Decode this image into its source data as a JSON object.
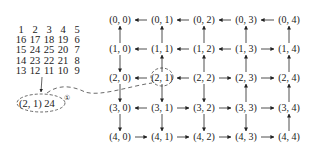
{
  "spiral_matrix": {
    "rows": [
      [
        "1",
        "2",
        "3",
        "4",
        "5"
      ],
      [
        "16",
        "17",
        "18",
        "19",
        "6"
      ],
      [
        "15",
        "24",
        "25",
        "20",
        "7"
      ],
      [
        "14",
        "23",
        "22",
        "21",
        "8"
      ],
      [
        "13",
        "12",
        "11",
        "10",
        "9"
      ]
    ]
  },
  "callout": {
    "label": "(2, 1)  24",
    "marker": "①"
  },
  "grid": {
    "rows": 5,
    "cols": 5,
    "nodes": [
      [
        "(0, 0)",
        "(0, 1)",
        "(0, 2)",
        "(0, 3)",
        "(0, 4)"
      ],
      [
        "(1, 0)",
        "(1, 1)",
        "(1, 2)",
        "(1, 3)",
        "(1, 4)"
      ],
      [
        "(2, 0)",
        "(2, 1)",
        "(2, 2)",
        "(2, 3)",
        "(2, 4)"
      ],
      [
        "(3, 0)",
        "(3, 1)",
        "(3, 2)",
        "(3, 3)",
        "(3, 4)"
      ],
      [
        "(4, 0)",
        "(4, 1)",
        "(4, 2)",
        "(4, 3)",
        "(4, 4)"
      ]
    ],
    "horizontal_arrows": [
      [
        "left",
        "left",
        "left",
        "left"
      ],
      [
        "left",
        "left",
        "left",
        "right"
      ],
      [
        "left",
        "left",
        "right",
        "right"
      ],
      [
        "left",
        "right",
        "right",
        "right"
      ],
      [
        "right",
        "right",
        "right",
        "right"
      ]
    ],
    "vertical_arrows": [
      [
        "up",
        "up",
        "up",
        "up",
        "up"
      ],
      [
        "down",
        "up",
        "up",
        "up",
        "up"
      ],
      [
        "down",
        "down",
        "down",
        "up",
        "up"
      ],
      [
        "down",
        "down",
        "down",
        "down",
        "up"
      ]
    ],
    "highlighted_node": "(2, 1)"
  }
}
